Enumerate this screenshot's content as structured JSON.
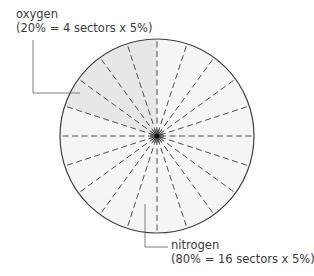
{
  "diagram": {
    "center": [
      157,
      136
    ],
    "radius": 97,
    "sector_count": 20,
    "sector_percent": 5,
    "colors": {
      "oxygen_fill": "#e7e7e7",
      "nitrogen_fill": "#f5f5f5",
      "outline": "#404040",
      "dash": "#505050",
      "leader": "#606060",
      "hub": "#111111"
    },
    "segments": [
      {
        "name": "oxygen",
        "sectors": 4,
        "percent": 20,
        "start_angle_deg": 90,
        "end_angle_deg": 162
      },
      {
        "name": "nitrogen",
        "sectors": 16,
        "percent": 80,
        "start_angle_deg": 162,
        "end_angle_deg": 450
      }
    ]
  },
  "labels": {
    "oxygen": {
      "title": "oxygen",
      "detail": "(20% = 4 sectors x 5%)"
    },
    "nitrogen": {
      "title": "nitrogen",
      "detail": "(80% = 16 sectors x 5%)"
    }
  }
}
